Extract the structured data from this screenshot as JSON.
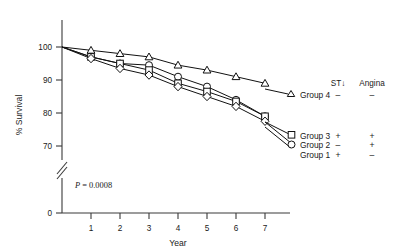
{
  "chart_data": {
    "type": "line",
    "title": "",
    "xlabel": "Year",
    "ylabel": "% Survival",
    "x": [
      0,
      1,
      2,
      3,
      4,
      5,
      6,
      7
    ],
    "xlim": [
      0,
      7.4
    ],
    "ylim": [
      70,
      101
    ],
    "yticks": [
      0,
      70,
      80,
      90,
      100
    ],
    "ytick_labels": [
      "0",
      "70",
      "80",
      "90",
      "100"
    ],
    "xticks": [
      1,
      2,
      3,
      4,
      5,
      6,
      7
    ],
    "xtick_labels": [
      "1",
      "2",
      "3",
      "4",
      "5",
      "6",
      "7"
    ],
    "grid": false,
    "axis_break": true,
    "legend_position": "right",
    "annotation": {
      "p_label": "P",
      "p_equals": " = ",
      "p_value": "0.0008"
    },
    "series": [
      {
        "name": "Group 4",
        "marker": "triangle",
        "st_depression": "–",
        "angina": "–",
        "values": [
          100,
          99,
          98,
          97,
          94.5,
          93,
          91,
          89
        ]
      },
      {
        "name": "Group 3",
        "marker": "circle",
        "st_depression": "+",
        "angina": "+",
        "values": [
          100,
          97,
          95,
          94.5,
          91,
          88,
          84,
          79
        ]
      },
      {
        "name": "Group 2",
        "marker": "square",
        "st_depression": "–",
        "angina": "+",
        "values": [
          100,
          97,
          95,
          93,
          89,
          86.5,
          83.5,
          79
        ]
      },
      {
        "name": "Group 1",
        "marker": "diamond",
        "st_depression": "+",
        "angina": "–",
        "values": [
          100,
          96.5,
          93.5,
          91.5,
          88,
          85,
          82,
          77.5
        ]
      }
    ]
  },
  "legend": {
    "header_st": "ST↓",
    "header_angina": "Angina",
    "rows": [
      {
        "label": "Group 4",
        "st": "–",
        "angina": "–",
        "marker": "triangle"
      },
      {
        "label": "Group 3",
        "st": "+",
        "angina": "+",
        "marker": "square"
      },
      {
        "label": "Group 2",
        "st": "–",
        "angina": "+",
        "marker": "circle"
      },
      {
        "label": "Group 1",
        "st": "+",
        "angina": "–",
        "marker": "diamond"
      }
    ]
  }
}
